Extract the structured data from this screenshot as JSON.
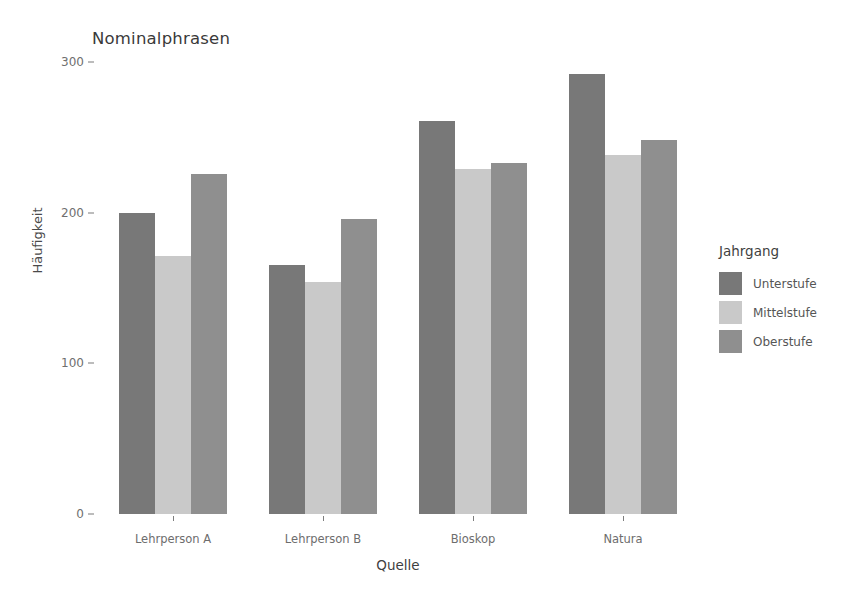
{
  "chart_data": {
    "type": "bar",
    "title": "Nominalphrasen",
    "xlabel": "Quelle",
    "ylabel": "Häufigkeit",
    "categories": [
      "Lehrperson A",
      "Lehrperson B",
      "Bioskop",
      "Natura"
    ],
    "legend_title": "Jahrgang",
    "legend_position": "right",
    "grid": false,
    "ylim": [
      0,
      300
    ],
    "yticks": [
      0,
      100,
      200,
      300
    ],
    "ytick_labels": [
      "0",
      "100",
      "200",
      "300"
    ],
    "series": [
      {
        "name": "Unterstufe",
        "color": "#787878",
        "values": [
          200,
          165,
          261,
          292
        ]
      },
      {
        "name": "Mittelstufe",
        "color": "#c9c9c9",
        "values": [
          171,
          154,
          229,
          238
        ]
      },
      {
        "name": "Oberstufe",
        "color": "#8f8f8f",
        "values": [
          226,
          196,
          233,
          248
        ]
      }
    ]
  },
  "figure": {
    "background": "#ffffff",
    "axis_color": "#9a9a9a",
    "tick_color": "#7a7a7a",
    "text_color": "#4d4d4d"
  }
}
